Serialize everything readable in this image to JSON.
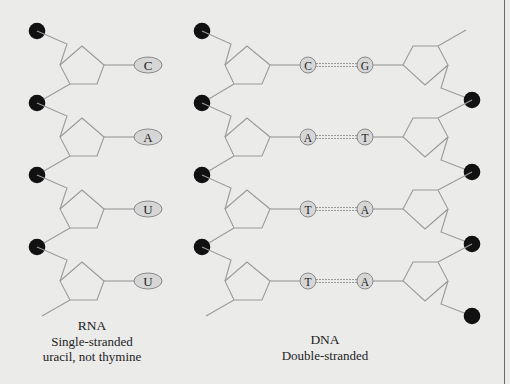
{
  "diagram": {
    "colors": {
      "background": "#ebebea",
      "backbone_line": "#9a9a9a",
      "phosphate": "#111111",
      "base_fill": "#d6d6d6",
      "base_stroke": "#8a8a8a",
      "base_text": "#222222",
      "border": "#6a6a6a"
    },
    "legend_note": "Black circles = phosphate groups; pentagons = sugars; ovals/circles = nitrogenous bases"
  },
  "rna": {
    "label_title": "RNA",
    "label_line1": "Single-stranded",
    "label_line2": "uracil, not thymine",
    "bases": [
      "C",
      "A",
      "U",
      "U"
    ]
  },
  "dna": {
    "label_title": "DNA",
    "label_line1": "Double-stranded",
    "pairs": [
      {
        "left": "C",
        "right": "G"
      },
      {
        "left": "A",
        "right": "T"
      },
      {
        "left": "T",
        "right": "A"
      },
      {
        "left": "T",
        "right": "A"
      }
    ]
  }
}
